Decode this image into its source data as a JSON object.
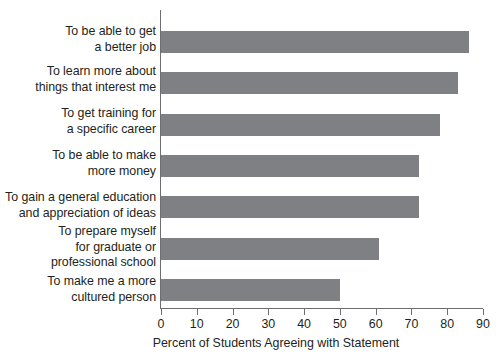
{
  "chart_data": {
    "type": "bar",
    "orientation": "horizontal",
    "title": "",
    "xlabel": "Percent of Students Agreeing with Statement",
    "ylabel": "",
    "xlim": [
      0,
      90
    ],
    "xticks": [
      0,
      10,
      20,
      30,
      40,
      50,
      60,
      70,
      80,
      90
    ],
    "grid": false,
    "legend": false,
    "bar_color": "#7f8083",
    "axis_color": "#6d6e71",
    "categories": [
      "To be able to get\na better job",
      "To learn more about\nthings that interest me",
      "To get training for\na specific career",
      "To be able to make\nmore money",
      "To gain a general education\nand appreciation of ideas",
      "To prepare myself\nfor graduate or\nprofessional school",
      "To make me a more\ncultured person"
    ],
    "values": [
      86,
      83,
      78,
      72,
      72,
      61,
      50
    ]
  }
}
